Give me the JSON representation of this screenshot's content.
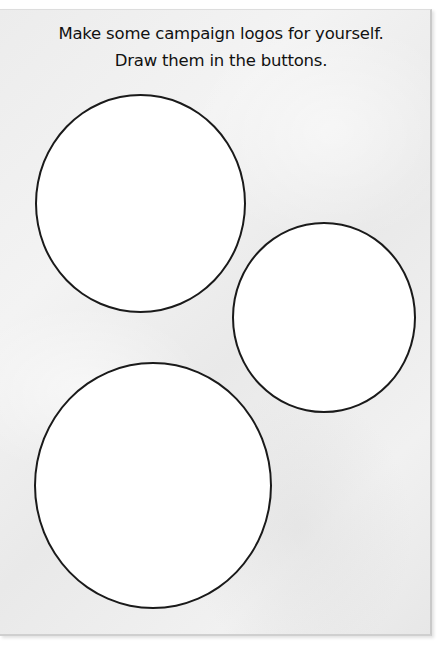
{
  "worksheet": {
    "instructions": {
      "line_1": "Make some campaign logos for yourself.",
      "line_2": "Draw them in the buttons."
    },
    "buttons": [
      {
        "id": "circle-1",
        "label": "",
        "size": "large",
        "position": "top-left"
      },
      {
        "id": "circle-2",
        "label": "",
        "size": "medium",
        "position": "middle-right"
      },
      {
        "id": "circle-3",
        "label": "",
        "size": "large",
        "position": "bottom-left"
      }
    ],
    "colors": {
      "paper": "#eeeeee",
      "circle_fill": "#ffffff",
      "circle_stroke": "#1a1a1a",
      "text": "#111111"
    }
  }
}
